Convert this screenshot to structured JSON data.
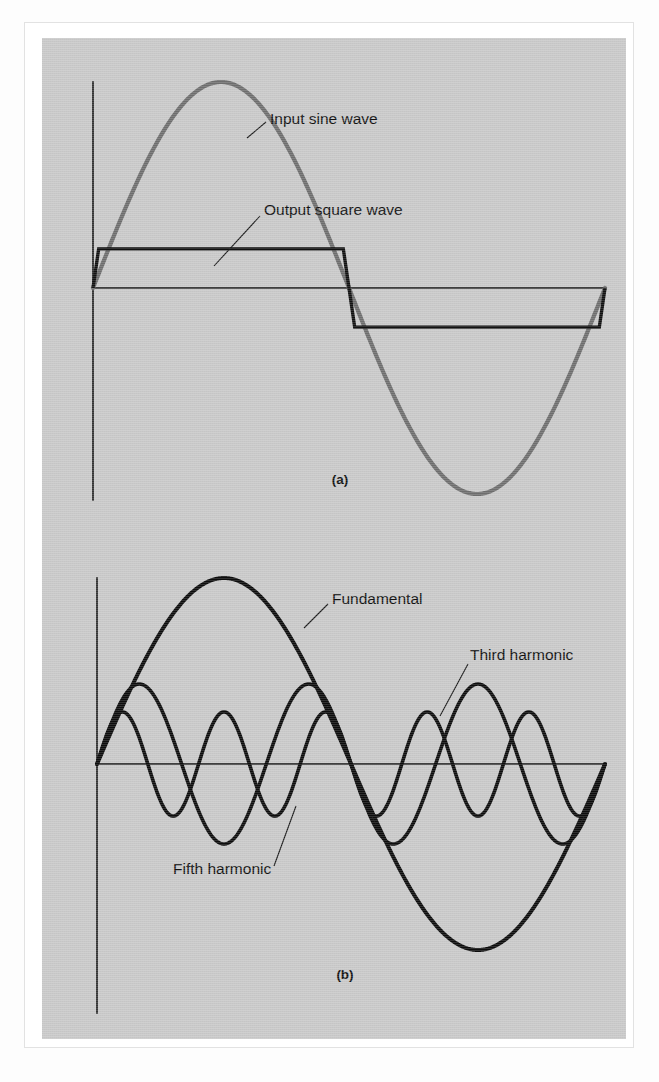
{
  "figure": {
    "background_color": "#c9c9c9",
    "frame_color": "#e2e2e2",
    "page_color": "#ffffff"
  },
  "panels": [
    {
      "id": "panel-a",
      "caption": "(a)",
      "caption_x": 298,
      "caption_y": 442,
      "labels": [
        {
          "name": "input-sine-wave",
          "text": "Input sine wave",
          "x": 228,
          "y": 82,
          "leader": "M 224 84 L 205 100"
        },
        {
          "name": "output-square-wave",
          "text": "Output square wave",
          "x": 222,
          "y": 173,
          "leader": "M 218 178 L 172 228"
        }
      ],
      "axes": {
        "y_axis": "M 51 44 L 51 462",
        "x_axis": "M 51 250 L 563 250"
      },
      "curves": [
        {
          "name": "input-sine-wave-curve",
          "class": "sine-input",
          "color": "#6e6e6e",
          "width": 4.2
        },
        {
          "name": "output-square-wave-curve",
          "class": "square-output",
          "color": "#111111",
          "width": 3.4
        }
      ]
    },
    {
      "id": "panel-b",
      "caption": "(b)",
      "caption_x": 303,
      "caption_y": 937,
      "labels": [
        {
          "name": "fundamental",
          "text": "Fundamental",
          "x": 290,
          "y": 562,
          "leader": "M 286 566 L 262 590"
        },
        {
          "name": "third-harmonic",
          "text": "Third harmonic",
          "x": 428,
          "y": 618,
          "leader": "M 426 626 L 398 678"
        },
        {
          "name": "fifth-harmonic",
          "text": "Fifth harmonic",
          "x": 131,
          "y": 832,
          "leader": "M 232 828 L 254 768"
        }
      ],
      "axes": {
        "y_axis": "M 55 540 L 55 975",
        "x_axis": "M 55 726 L 563 726"
      },
      "curves": [
        {
          "name": "fundamental-curve",
          "class": "harmonic harmonic-fundamental",
          "color": "#0d0d0d",
          "width": 4.0
        },
        {
          "name": "third-harmonic-curve",
          "class": "harmonic harmonic-third",
          "color": "#0d0d0d",
          "width": 3.6
        },
        {
          "name": "fifth-harmonic-curve",
          "class": "harmonic harmonic-fifth",
          "color": "#0d0d0d",
          "width": 3.6
        }
      ]
    }
  ],
  "chart_data": [
    {
      "type": "line",
      "id": "panel-a",
      "title": "(a)",
      "xlabel": "",
      "ylabel": "",
      "grid": false,
      "legend": "inline-annotations",
      "x_range_cycles": [
        0,
        1
      ],
      "ylim": [
        -1.1,
        1.1
      ],
      "series": [
        {
          "name": "Input sine wave",
          "shape": "sine",
          "cycles": 1,
          "amplitude": 1.0,
          "phase_deg": 0,
          "color": "#6e6e6e",
          "key_points": [
            {
              "phase_deg": 0,
              "value": 0.0
            },
            {
              "phase_deg": 90,
              "value": 1.0
            },
            {
              "phase_deg": 180,
              "value": 0.0
            },
            {
              "phase_deg": 270,
              "value": -1.0
            },
            {
              "phase_deg": 360,
              "value": 0.0
            }
          ]
        },
        {
          "name": "Output square wave",
          "shape": "square",
          "cycles": 1,
          "amplitude": 0.19,
          "phase_deg": 0,
          "color": "#111111",
          "key_points": [
            {
              "phase_deg": 0,
              "value": 0.0
            },
            {
              "phase_deg": 4,
              "value": 0.19
            },
            {
              "phase_deg": 176,
              "value": 0.19
            },
            {
              "phase_deg": 184,
              "value": -0.19
            },
            {
              "phase_deg": 356,
              "value": -0.19
            },
            {
              "phase_deg": 360,
              "value": 0.0
            }
          ]
        }
      ]
    },
    {
      "type": "line",
      "id": "panel-b",
      "title": "(b)",
      "xlabel": "",
      "ylabel": "",
      "grid": false,
      "legend": "inline-annotations",
      "x_range_cycles": [
        0,
        1
      ],
      "ylim": [
        -1.1,
        1.1
      ],
      "series": [
        {
          "name": "Fundamental",
          "shape": "sine",
          "cycles": 1,
          "amplitude": 1.0,
          "phase_deg": 0,
          "color": "#0d0d0d"
        },
        {
          "name": "Third harmonic",
          "shape": "sine",
          "cycles": 3,
          "amplitude": 0.43,
          "phase_deg": 0,
          "color": "#0d0d0d"
        },
        {
          "name": "Fifth harmonic",
          "shape": "sine",
          "cycles": 5,
          "amplitude": 0.28,
          "phase_deg": 0,
          "color": "#0d0d0d"
        }
      ]
    }
  ]
}
